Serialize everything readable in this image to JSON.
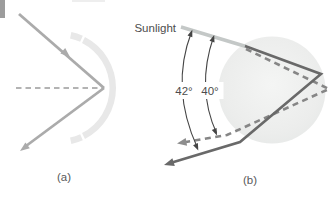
{
  "figure": {
    "panels": {
      "a": {
        "caption": "(a)"
      },
      "b": {
        "caption": "(b)",
        "sunlight_label": "Sunlight",
        "angles": {
          "outer": "42°",
          "inner": "40°"
        }
      }
    },
    "colors": {
      "panel_a_ray": "#ababab",
      "panel_a_arc": "#e8e8e8",
      "axis_dash": "#9a9a9a",
      "corner_bar": "#9c9c9c",
      "sunlight_ray": "#c4c8c7",
      "solid_ray": "#696969",
      "dashed_ray": "#868686",
      "dashed_ray_arrow": "#8e8e8e",
      "angle_arrow": "#454545",
      "droplet_edge": "#e7e9e8",
      "droplet_center": "#f4f5f4",
      "label_text": "#4d4d4d"
    }
  }
}
